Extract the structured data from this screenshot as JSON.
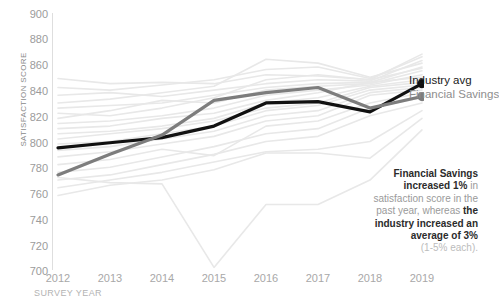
{
  "chart_data": {
    "type": "line",
    "title": "Financial Savings Satisfaction vs. Industry Average",
    "xlabel": "SURVEY YEAR",
    "ylabel": "SATISFACTION SCORE",
    "x": [
      2012,
      2013,
      2014,
      2015,
      2016,
      2017,
      2018,
      2019
    ],
    "xtick_labels": [
      "2012",
      "2013",
      "2014",
      "2015",
      "2016",
      "2017",
      "2018",
      "2019"
    ],
    "ylim": [
      700,
      900
    ],
    "ytick_labels": [
      "900",
      "880",
      "860",
      "840",
      "820",
      "800",
      "780",
      "760",
      "740",
      "720",
      "700"
    ],
    "ytick_values": [
      900,
      880,
      860,
      840,
      820,
      800,
      780,
      760,
      740,
      720,
      700
    ],
    "grid": false,
    "legend_position": "right-inline-endpoint",
    "series": [
      {
        "name": "Industry avg",
        "color": "#111111",
        "emphasis": "highlight",
        "endpoint_marker": true,
        "values": [
          795,
          799,
          803,
          812,
          830,
          831,
          823,
          845
        ]
      },
      {
        "name": "Financial Savings",
        "color": "#7d7d7d",
        "emphasis": "highlight",
        "endpoint_marker": true,
        "values": [
          774,
          790,
          805,
          832,
          838,
          842,
          826,
          835
        ]
      }
    ],
    "background_series": [
      {
        "name": "peer-01",
        "values": [
          849,
          845,
          846,
          845,
          852,
          851,
          848,
          868
        ]
      },
      {
        "name": "peer-02",
        "values": [
          842,
          840,
          844,
          848,
          856,
          858,
          849,
          866
        ]
      },
      {
        "name": "peer-03",
        "values": [
          836,
          838,
          835,
          840,
          845,
          848,
          847,
          863
        ]
      },
      {
        "name": "peer-04",
        "values": [
          830,
          833,
          838,
          843,
          864,
          861,
          850,
          861
        ]
      },
      {
        "name": "peer-05",
        "values": [
          826,
          828,
          830,
          836,
          842,
          845,
          846,
          858
        ]
      },
      {
        "name": "peer-06",
        "values": [
          822,
          820,
          826,
          834,
          848,
          852,
          848,
          857
        ]
      },
      {
        "name": "peer-07",
        "values": [
          818,
          824,
          832,
          830,
          840,
          843,
          845,
          855
        ]
      },
      {
        "name": "peer-08",
        "values": [
          814,
          816,
          820,
          826,
          836,
          840,
          844,
          852
        ]
      },
      {
        "name": "peer-09",
        "values": [
          810,
          812,
          818,
          822,
          832,
          838,
          846,
          850
        ]
      },
      {
        "name": "peer-10",
        "values": [
          806,
          808,
          812,
          818,
          830,
          834,
          843,
          848
        ]
      },
      {
        "name": "peer-11",
        "values": [
          802,
          806,
          810,
          816,
          826,
          830,
          842,
          846
        ]
      },
      {
        "name": "peer-12",
        "values": [
          798,
          800,
          806,
          812,
          824,
          828,
          840,
          844
        ]
      },
      {
        "name": "peer-13",
        "values": [
          793,
          796,
          802,
          808,
          820,
          824,
          838,
          842
        ]
      },
      {
        "name": "peer-14",
        "values": [
          788,
          792,
          798,
          804,
          816,
          820,
          836,
          840
        ]
      },
      {
        "name": "peer-15",
        "values": [
          782,
          786,
          794,
          789,
          812,
          816,
          830,
          838
        ]
      },
      {
        "name": "peer-16",
        "values": [
          776,
          780,
          788,
          796,
          806,
          810,
          826,
          834
        ]
      },
      {
        "name": "peer-17",
        "values": [
          770,
          774,
          782,
          790,
          800,
          804,
          820,
          830
        ]
      },
      {
        "name": "peer-18",
        "values": [
          764,
          770,
          776,
          784,
          792,
          794,
          800,
          824
        ]
      },
      {
        "name": "peer-19",
        "values": [
          758,
          766,
          770,
          778,
          791,
          791,
          787,
          818
        ]
      },
      {
        "name": "peer-20-low-outlier",
        "values": [
          772,
          768,
          767,
          702,
          751,
          751,
          770,
          809
        ]
      }
    ],
    "annotation": {
      "lines": [
        {
          "text": "Financial Savings",
          "bold": true
        },
        {
          "text": "increased 1%",
          "bold": true,
          "suffix": " in",
          "suffix_bold": false
        },
        {
          "text": "satisfaction score in the",
          "bold": false
        },
        {
          "text": "past year, whereas ",
          "bold": false,
          "suffix": "the",
          "suffix_bold": true
        },
        {
          "text": "industry increased an",
          "bold": true
        },
        {
          "text": "average of 3%",
          "bold": true
        },
        {
          "text": "(1-5% each).",
          "bold": false,
          "muted": true
        }
      ],
      "full_text": "Financial Savings increased 1% in satisfaction score in the past year, whereas the industry increased an average of 3% (1-5% each)."
    }
  },
  "colors": {
    "industry_avg": "#111111",
    "financial_savings": "#7d7d7d",
    "background_line": "#e8e8e8",
    "axis": "#dcdcdc",
    "tick_label": "#a0a0a0",
    "annotation_bold": "#2b2b2b",
    "annotation_regular": "#9a9a9a"
  }
}
